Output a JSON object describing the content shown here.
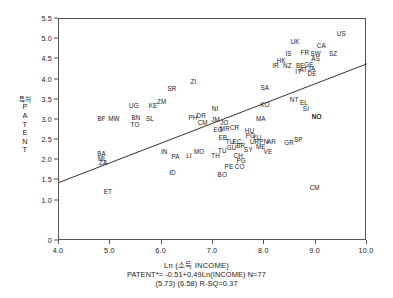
{
  "chart_data": {
    "type": "scatter",
    "title": "",
    "xlabel": "Ln (소득 INCOME)",
    "ylabel_kr": "특허",
    "ylabel_en": "PATENT",
    "xlim": [
      4.0,
      10.0
    ],
    "ylim": [
      0.0,
      5.5
    ],
    "xticks": [
      "4.0",
      "5.0",
      "6.0",
      "7.0",
      "8.0",
      "9.0",
      "10.0"
    ],
    "xtick_values": [
      4.0,
      5.0,
      6.0,
      7.0,
      8.0,
      9.0,
      10.0
    ],
    "yticks": [
      "0",
      "1.0",
      "1.5",
      "2.0",
      "2.5",
      "3.0",
      "3.5",
      "4.0",
      "4.5",
      "5.0",
      "5.5"
    ],
    "ytick_values": [
      0,
      1.0,
      1.5,
      2.0,
      2.5,
      3.0,
      3.5,
      4.0,
      4.5,
      5.0,
      5.5
    ],
    "grid": false,
    "legend": "none",
    "regression": {
      "equation": "PATENT*= -0.51+0.49Ln(INCOME) N=77",
      "stats": "(5.73) (6.58) R-SQ=0.37",
      "intercept": -0.51,
      "slope": 0.49,
      "n": 77,
      "r_squared": 0.37,
      "t_stats": [
        5.73,
        6.58
      ],
      "x_start": 4.0,
      "x_end": 10.0,
      "y_start": 1.45,
      "y_end": 4.39
    },
    "point_label": "country-code",
    "points": [
      {
        "label": "ET",
        "x": 4.95,
        "y": 1.25
      },
      {
        "label": "BA",
        "x": 4.83,
        "y": 2.17
      },
      {
        "label": "ML",
        "x": 4.84,
        "y": 2.06
      },
      {
        "label": "ZA",
        "x": 4.86,
        "y": 1.95
      },
      {
        "label": "BF",
        "x": 4.83,
        "y": 3.05
      },
      {
        "label": "MW",
        "x": 5.07,
        "y": 3.05
      },
      {
        "label": "UG",
        "x": 5.46,
        "y": 3.37
      },
      {
        "label": "TO",
        "x": 5.48,
        "y": 2.9
      },
      {
        "label": "BN",
        "x": 5.5,
        "y": 3.07
      },
      {
        "label": "KE",
        "x": 5.83,
        "y": 3.37
      },
      {
        "label": "SL",
        "x": 5.77,
        "y": 3.04
      },
      {
        "label": "ZM",
        "x": 6.0,
        "y": 3.47
      },
      {
        "label": "SR",
        "x": 6.2,
        "y": 3.8
      },
      {
        "label": "ZI",
        "x": 6.62,
        "y": 3.97
      },
      {
        "label": "ID",
        "x": 6.21,
        "y": 1.7
      },
      {
        "label": "IN",
        "x": 6.05,
        "y": 2.22
      },
      {
        "label": "PA",
        "x": 6.27,
        "y": 2.1
      },
      {
        "label": "LI",
        "x": 6.53,
        "y": 2.12
      },
      {
        "label": "MO",
        "x": 6.73,
        "y": 2.22
      },
      {
        "label": "PH",
        "x": 6.61,
        "y": 3.07
      },
      {
        "label": "DR",
        "x": 6.77,
        "y": 3.13
      },
      {
        "label": "CM",
        "x": 6.8,
        "y": 2.94
      },
      {
        "label": "NI",
        "x": 7.04,
        "y": 3.29
      },
      {
        "label": "JM",
        "x": 7.05,
        "y": 3.02
      },
      {
        "label": "JO",
        "x": 7.22,
        "y": 2.96
      },
      {
        "label": "EG",
        "x": 7.1,
        "y": 2.77
      },
      {
        "label": "MR",
        "x": 7.23,
        "y": 2.8
      },
      {
        "label": "CR",
        "x": 7.42,
        "y": 2.82
      },
      {
        "label": "EB",
        "x": 7.19,
        "y": 2.58
      },
      {
        "label": "TU",
        "x": 7.33,
        "y": 2.47
      },
      {
        "label": "EC",
        "x": 7.47,
        "y": 2.47
      },
      {
        "label": "TU2",
        "x": 7.18,
        "y": 2.25
      },
      {
        "label": "GU",
        "x": 7.36,
        "y": 2.33
      },
      {
        "label": "BR",
        "x": 7.54,
        "y": 2.38
      },
      {
        "label": "SY",
        "x": 7.69,
        "y": 2.29
      },
      {
        "label": "TH",
        "x": 7.05,
        "y": 2.14
      },
      {
        "label": "CH",
        "x": 7.49,
        "y": 2.14
      },
      {
        "label": "PG",
        "x": 7.55,
        "y": 2.01
      },
      {
        "label": "PE",
        "x": 7.31,
        "y": 1.87
      },
      {
        "label": "CO",
        "x": 7.52,
        "y": 1.85
      },
      {
        "label": "BO",
        "x": 7.18,
        "y": 1.65
      },
      {
        "label": "VE",
        "x": 8.07,
        "y": 2.22
      },
      {
        "label": "HU",
        "x": 7.71,
        "y": 2.74
      },
      {
        "label": "PO",
        "x": 7.73,
        "y": 2.62
      },
      {
        "label": "YU",
        "x": 7.85,
        "y": 2.57
      },
      {
        "label": "UR",
        "x": 7.81,
        "y": 2.47
      },
      {
        "label": "PN",
        "x": 7.99,
        "y": 2.47
      },
      {
        "label": "AR",
        "x": 8.14,
        "y": 2.47
      },
      {
        "label": "ME",
        "x": 7.93,
        "y": 2.36
      },
      {
        "label": "MA",
        "x": 7.93,
        "y": 3.04
      },
      {
        "label": "KO",
        "x": 8.01,
        "y": 3.4
      },
      {
        "label": "SA",
        "x": 8.01,
        "y": 3.81
      },
      {
        "label": "GR",
        "x": 8.48,
        "y": 2.46
      },
      {
        "label": "SP",
        "x": 8.66,
        "y": 2.52
      },
      {
        "label": "SI",
        "x": 8.81,
        "y": 3.3
      },
      {
        "label": "NO",
        "x": 9.02,
        "y": 3.1
      },
      {
        "label": "CM2",
        "x": 8.98,
        "y": 1.35
      },
      {
        "label": "NT",
        "x": 8.58,
        "y": 3.53
      },
      {
        "label": "EL",
        "x": 8.77,
        "y": 3.44
      },
      {
        "label": "IR",
        "x": 8.22,
        "y": 4.36
      },
      {
        "label": "HK",
        "x": 8.33,
        "y": 4.48
      },
      {
        "label": "NZ",
        "x": 8.45,
        "y": 4.35
      },
      {
        "label": "IS",
        "x": 8.47,
        "y": 4.67
      },
      {
        "label": "IT",
        "x": 8.66,
        "y": 4.22
      },
      {
        "label": "BE",
        "x": 8.7,
        "y": 4.35
      },
      {
        "label": "AT",
        "x": 8.76,
        "y": 4.27
      },
      {
        "label": "FR",
        "x": 8.79,
        "y": 4.68
      },
      {
        "label": "GE",
        "x": 8.87,
        "y": 4.38
      },
      {
        "label": "JA",
        "x": 8.92,
        "y": 4.29
      },
      {
        "label": "DE",
        "x": 8.93,
        "y": 4.17
      },
      {
        "label": "SW",
        "x": 9.0,
        "y": 4.65
      },
      {
        "label": "AS",
        "x": 9.0,
        "y": 4.54
      },
      {
        "label": "UK",
        "x": 8.6,
        "y": 4.95
      },
      {
        "label": "CA",
        "x": 9.11,
        "y": 4.86
      },
      {
        "label": "SZ",
        "x": 9.34,
        "y": 4.66
      },
      {
        "label": "US",
        "x": 9.5,
        "y": 5.15
      },
      {
        "label": "NO2",
        "x": 9.02,
        "y": 3.1
      }
    ]
  }
}
